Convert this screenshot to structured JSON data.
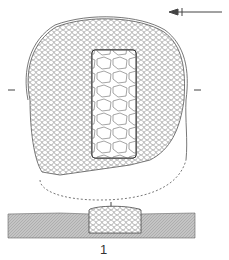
{
  "figure": {
    "label": "1",
    "north_arrow": {
      "direction": "left",
      "color": "#333333"
    },
    "section_marker": "I",
    "colors": {
      "line": "#444444",
      "ground": "#bdbdbd",
      "background": "#ffffff"
    }
  }
}
